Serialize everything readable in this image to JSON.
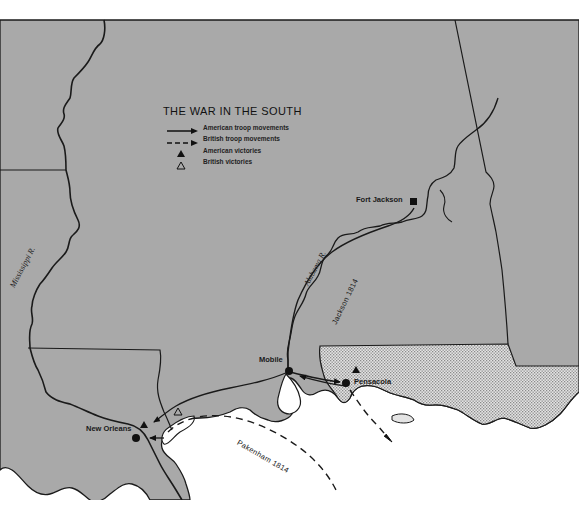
{
  "map": {
    "title": "THE WAR IN THE SOUTH",
    "colors": {
      "land": "#a9a9a9",
      "water": "#ffffff",
      "spanish_florida_hatch": "#d9d9d9",
      "lines": "#1a1a1a"
    },
    "legend": [
      {
        "symbol": "solid-arrow",
        "label": "American troop movements"
      },
      {
        "symbol": "dashed-arrow",
        "label": "British troop movements"
      },
      {
        "symbol": "filled-triangle",
        "label": "American victories"
      },
      {
        "symbol": "open-triangle",
        "label": "British victories"
      }
    ],
    "places": {
      "fort_jackson": "Fort Jackson",
      "mobile": "Mobile",
      "pensacola": "Pensacola",
      "new_orleans": "New Orleans"
    },
    "rivers": {
      "mississippi": "Mississippi R.",
      "alabama": "Alabama R."
    },
    "routes": {
      "jackson": "Jackson 1814",
      "pakenham": "Pakenham 1814"
    }
  }
}
